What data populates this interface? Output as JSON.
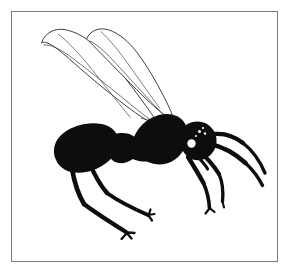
{
  "figure": {
    "caption": "Black silhouette drawing of a winged ant (alate) in left lateral view, enclosed in a thin rectangular frame.",
    "view": "lateral",
    "technique": "ink-silhouette-line-drawing",
    "background_color": "#ffffff",
    "ink_color": "#0d0d0d",
    "line_color": "#262626",
    "frame": {
      "color": "#7c7c7c",
      "thickness_px": 1,
      "x": 11,
      "y": 11,
      "width": 267,
      "height": 251
    }
  },
  "parts": [
    {
      "id": "forewing",
      "label": "Forewing",
      "style": "outline",
      "fill": "#ffffff",
      "stroke": "#262626"
    },
    {
      "id": "hindwing",
      "label": "Hindwing",
      "style": "outline",
      "fill": "#ffffff",
      "stroke": "#262626"
    },
    {
      "id": "gaster",
      "label": "Gaster (abdomen)",
      "style": "solid",
      "fill": "#0d0d0d"
    },
    {
      "id": "petiole",
      "label": "Petiole",
      "style": "solid",
      "fill": "#0d0d0d"
    },
    {
      "id": "mesosoma",
      "label": "Mesosoma (thorax)",
      "style": "solid",
      "fill": "#0d0d0d"
    },
    {
      "id": "head",
      "label": "Head",
      "style": "solid",
      "fill": "#0d0d0d"
    },
    {
      "id": "eye",
      "label": "Compound eye",
      "style": "reversed",
      "fill": "#ffffff"
    },
    {
      "id": "ocelli",
      "label": "Ocelli",
      "style": "reversed",
      "fill": "#ffffff"
    },
    {
      "id": "antenna",
      "label": "Antenna",
      "style": "solid",
      "fill": "#0d0d0d"
    },
    {
      "id": "foreleg",
      "label": "Foreleg",
      "style": "solid",
      "fill": "#0d0d0d"
    },
    {
      "id": "midleg",
      "label": "Midleg",
      "style": "solid",
      "fill": "#0d0d0d"
    },
    {
      "id": "hindleg",
      "label": "Hindleg",
      "style": "solid",
      "fill": "#0d0d0d"
    }
  ]
}
